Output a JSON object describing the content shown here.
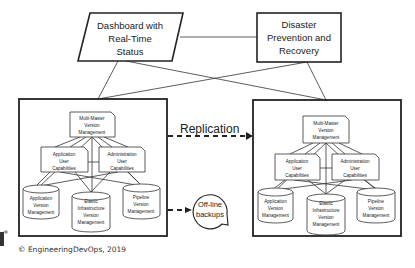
{
  "top": {
    "dashboard": {
      "lines": [
        "Dashboard with",
        "Real-Time",
        "Status"
      ]
    },
    "disaster": {
      "lines": [
        "Disaster",
        "Prevention and",
        "Recovery"
      ]
    }
  },
  "panels": {
    "left": {
      "multi_master": {
        "lines": [
          "Multi-Master",
          "Version",
          "Management"
        ]
      },
      "app_user": {
        "lines": [
          "Application",
          "User",
          "Capabilities"
        ]
      },
      "admin_user": {
        "lines": [
          "Administration",
          "User",
          "Capabilities"
        ]
      },
      "app_version": {
        "lines": [
          "Application",
          "Version",
          "Management"
        ]
      },
      "elastic": {
        "lines": [
          "Elastic",
          "Infrastructure",
          "Version",
          "Management"
        ]
      },
      "pipeline": {
        "lines": [
          "Pipeline",
          "Version",
          "Management"
        ]
      }
    },
    "right": {
      "multi_master": {
        "lines": [
          "Multi-Master",
          "Version",
          "Management"
        ]
      },
      "app_user": {
        "lines": [
          "Application",
          "User",
          "Capabilities"
        ]
      },
      "admin_user": {
        "lines": [
          "Administration",
          "User",
          "Capabilities"
        ]
      },
      "app_version": {
        "lines": [
          "Application",
          "Version",
          "Management"
        ]
      },
      "elastic": {
        "lines": [
          "Elastic",
          "Infrastructure",
          "Version",
          "Management"
        ]
      },
      "pipeline": {
        "lines": [
          "Pipeline",
          "Version",
          "Management"
        ]
      }
    }
  },
  "replication_label": "Replication",
  "backups": {
    "lines": [
      "Off-line",
      "backups"
    ]
  },
  "copyright": "© EngineeringDevOps, 2019"
}
